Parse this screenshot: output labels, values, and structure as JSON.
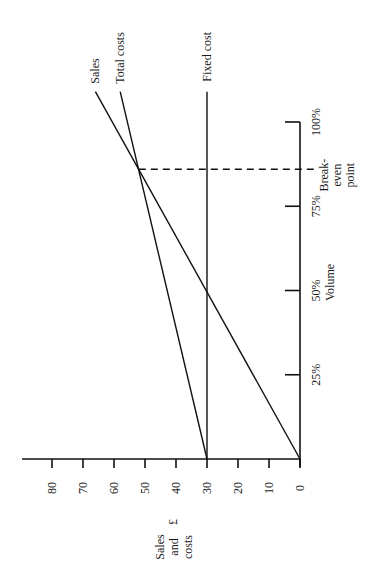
{
  "chart_data": {
    "type": "line",
    "title": "",
    "orientation": "rotated-90-ccw",
    "xlabel": "Volume",
    "ylabel": "Sales and costs £",
    "xlim": [
      0,
      100
    ],
    "ylim": [
      0,
      85
    ],
    "x_unit": "%",
    "x_ticks": [
      0,
      25,
      50,
      75,
      100
    ],
    "x_tick_labels": [
      "",
      "25%",
      "50%",
      "75%",
      "100%"
    ],
    "y_ticks": [
      0,
      10,
      20,
      30,
      40,
      50,
      60,
      70,
      80
    ],
    "y_tick_labels": [
      "0",
      "10",
      "20",
      "30",
      "40",
      "50",
      "60",
      "70",
      "80"
    ],
    "y_axis_title_lines": [
      "Sales",
      "and",
      "costs"
    ],
    "y_axis_currency": "£",
    "grid": false,
    "series": [
      {
        "name": "Sales",
        "x": [
          0,
          109
        ],
        "y": [
          0,
          66
        ]
      },
      {
        "name": "Total costs",
        "x": [
          0,
          109
        ],
        "y": [
          30,
          58
        ]
      },
      {
        "name": "Fixed cost",
        "x": [
          0,
          109
        ],
        "y": [
          30,
          30
        ]
      }
    ],
    "annotations": [
      {
        "type": "dashed-vertical",
        "x": 86,
        "from_y": 0,
        "to_y": 52,
        "label_lines": [
          "Break-",
          "even",
          "point"
        ]
      }
    ]
  }
}
